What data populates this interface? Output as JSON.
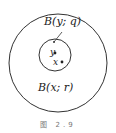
{
  "figure": {
    "outer_ball_label": "B(x; r)",
    "inner_ball_label": "B(y; q)",
    "point_y_label": "y",
    "point_x_label": "x",
    "caption": "图  2.9"
  },
  "colors": {
    "stroke": "#333333",
    "background": "#ffffff"
  }
}
